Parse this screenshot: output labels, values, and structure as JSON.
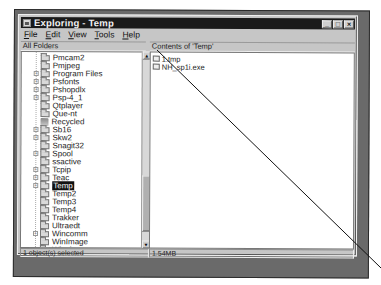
{
  "window": {
    "title": "Exploring - Temp",
    "buttons": {
      "minimize": "_",
      "maximize": "□",
      "close": "×"
    }
  },
  "menu": [
    "File",
    "Edit",
    "View",
    "Tools",
    "Help"
  ],
  "panes": {
    "left_header": "All Folders",
    "right_header": "Contents of 'Temp'"
  },
  "tree": [
    {
      "label": "Pmcam2",
      "expandable": false
    },
    {
      "label": "Pmjpeg",
      "expandable": false
    },
    {
      "label": "Program Files",
      "expandable": true
    },
    {
      "label": "Psfonts",
      "expandable": true
    },
    {
      "label": "Pshopdlx",
      "expandable": true
    },
    {
      "label": "Psp-4_1",
      "expandable": true
    },
    {
      "label": "Qtplayer",
      "expandable": false
    },
    {
      "label": "Que-nt",
      "expandable": false
    },
    {
      "label": "Recycled",
      "expandable": false,
      "icon": "recycle-bin-icon"
    },
    {
      "label": "Sb16",
      "expandable": true
    },
    {
      "label": "Skw2",
      "expandable": true
    },
    {
      "label": "Snagit32",
      "expandable": false
    },
    {
      "label": "Spool",
      "expandable": true
    },
    {
      "label": "ssactive",
      "expandable": false
    },
    {
      "label": "Tcpip",
      "expandable": true
    },
    {
      "label": "Teac",
      "expandable": true
    },
    {
      "label": "Temp",
      "expandable": true,
      "selected": true
    },
    {
      "label": "Temp2",
      "expandable": false
    },
    {
      "label": "Temp3",
      "expandable": false
    },
    {
      "label": "Temp4",
      "expandable": false
    },
    {
      "label": "Trakker",
      "expandable": false
    },
    {
      "label": "Ultraedt",
      "expandable": false
    },
    {
      "label": "Wincomm",
      "expandable": true
    },
    {
      "label": "WinImage",
      "expandable": false
    },
    {
      "label": "Winzip",
      "expandable": false
    }
  ],
  "files": [
    {
      "name": "1.tmp"
    },
    {
      "name": "NH_sp1i.exe"
    }
  ],
  "status": {
    "selection": "1 object(s) selected",
    "size": "1.54MB"
  }
}
